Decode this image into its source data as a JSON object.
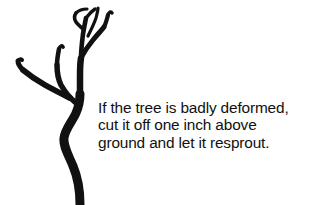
{
  "page": {
    "background_color": "#ffffff",
    "ink_color": "#111111",
    "width": 313,
    "height": 205
  },
  "illustration": {
    "name": "bare-deformed-sapling-tree",
    "description": "Black silhouette of a leafless deformed young tree with an S-curved trunk and several upward branches",
    "color": "#111111"
  },
  "caption": {
    "lines": [
      "If the tree is badly deformed,",
      "cut it off one inch above",
      "ground and let it resprout."
    ],
    "full_text": "If the tree is badly deformed, cut it off one inch above ground and let it resprout."
  }
}
